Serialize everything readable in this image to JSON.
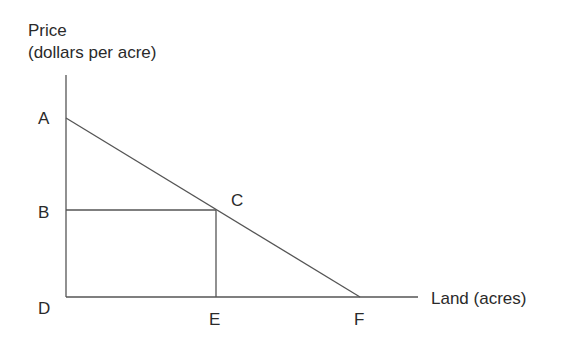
{
  "axes": {
    "y_label_line1": "Price",
    "y_label_line2": "(dollars per acre)",
    "x_label": "Land (acres)"
  },
  "points": {
    "A": "A",
    "B": "B",
    "C": "C",
    "D": "D",
    "E": "E",
    "F": "F"
  },
  "colors": {
    "line": "#555555",
    "text": "#2a2a2a"
  }
}
